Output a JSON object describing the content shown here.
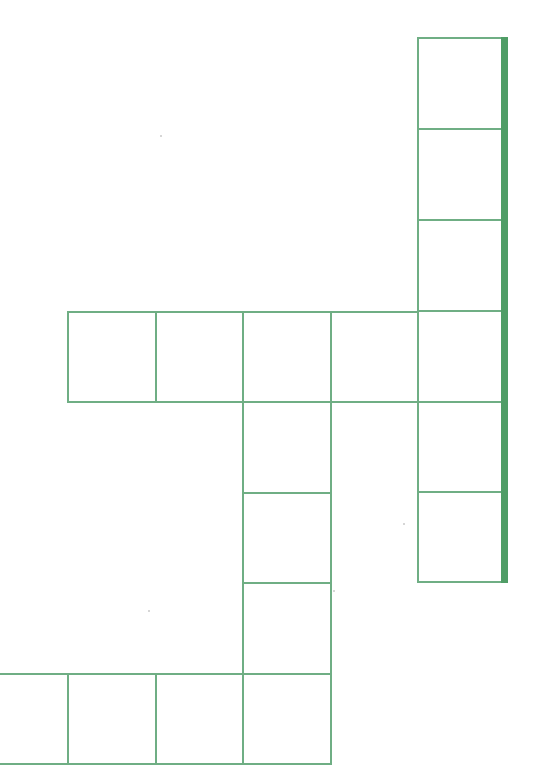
{
  "puzzle": {
    "type": "crossword-grid",
    "line_color": "#6fae84",
    "accent_edge_color": "#4f9d66",
    "cells": [
      {
        "x": 417,
        "y": 37,
        "w": 86,
        "h": 93
      },
      {
        "x": 417,
        "y": 128,
        "w": 86,
        "h": 93
      },
      {
        "x": 417,
        "y": 219,
        "w": 86,
        "h": 93
      },
      {
        "x": 417,
        "y": 310,
        "w": 86,
        "h": 93
      },
      {
        "x": 417,
        "y": 401,
        "w": 86,
        "h": 93
      },
      {
        "x": 417,
        "y": 491,
        "w": 86,
        "h": 92
      },
      {
        "x": 67,
        "y": 311,
        "w": 90,
        "h": 92
      },
      {
        "x": 155,
        "y": 311,
        "w": 89,
        "h": 92
      },
      {
        "x": 242,
        "y": 311,
        "w": 90,
        "h": 92
      },
      {
        "x": 330,
        "y": 311,
        "w": 89,
        "h": 92
      },
      {
        "x": 242,
        "y": 401,
        "w": 90,
        "h": 93
      },
      {
        "x": 242,
        "y": 492,
        "w": 90,
        "h": 93
      },
      {
        "x": 242,
        "y": 582,
        "w": 90,
        "h": 93
      },
      {
        "x": -2,
        "y": 673,
        "w": 71,
        "h": 92
      },
      {
        "x": 67,
        "y": 673,
        "w": 90,
        "h": 92
      },
      {
        "x": 155,
        "y": 673,
        "w": 89,
        "h": 92
      },
      {
        "x": 242,
        "y": 673,
        "w": 90,
        "h": 92
      }
    ]
  }
}
